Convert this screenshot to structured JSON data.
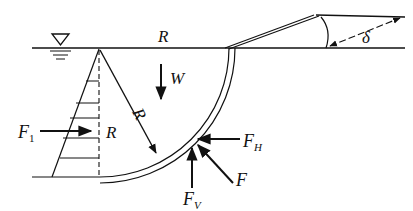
{
  "diagram": {
    "type": "hydrostatic-force-on-curved-gate",
    "labels": {
      "radius_top": "R",
      "radius_diag": "R",
      "radius_side": "R",
      "weight": "W",
      "force_horizontal_left": "F",
      "force_horizontal_left_sub": "1",
      "force_h": "F",
      "force_h_sub": "H",
      "force_v": "F",
      "force_v_sub": "V",
      "force_resultant": "F",
      "angle": "δ"
    },
    "symbols": {
      "water_surface": "free-surface-triangle"
    },
    "colors": {
      "stroke": "#111111",
      "background": "#ffffff"
    }
  }
}
